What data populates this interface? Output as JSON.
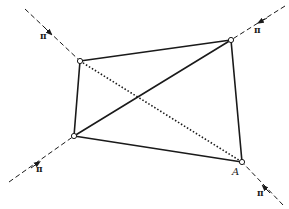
{
  "figure": {
    "colors": {
      "ink": "#1a1a1a",
      "background": "#ffffff"
    },
    "nodes": [
      {
        "id": "top-left",
        "x": 80,
        "y": 61
      },
      {
        "id": "top-right",
        "x": 231,
        "y": 40
      },
      {
        "id": "bottom-left",
        "x": 74,
        "y": 136
      },
      {
        "id": "bottom-right",
        "x": 242,
        "y": 162,
        "label": "A"
      }
    ],
    "members": [
      {
        "from": "top-left",
        "to": "top-right",
        "style": "solid"
      },
      {
        "from": "top-right",
        "to": "bottom-right",
        "style": "solid"
      },
      {
        "from": "bottom-right",
        "to": "bottom-left",
        "style": "solid"
      },
      {
        "from": "bottom-left",
        "to": "top-left",
        "style": "solid"
      },
      {
        "from": "bottom-left",
        "to": "top-right",
        "style": "solid"
      },
      {
        "from": "top-left",
        "to": "bottom-right",
        "style": "dotted"
      }
    ],
    "forces": [
      {
        "node": "top-left",
        "label": "π",
        "direction": "toward node"
      },
      {
        "node": "top-right",
        "label": "π",
        "direction": "toward node"
      },
      {
        "node": "bottom-left",
        "label": "π",
        "direction": "toward node"
      },
      {
        "node": "bottom-right",
        "label": "π",
        "direction": "toward node"
      }
    ],
    "labels": {
      "pi_top_left": "π",
      "pi_top_right": "π",
      "pi_bottom_left": "π",
      "pi_bottom_right": "π",
      "node_A": "A"
    }
  }
}
